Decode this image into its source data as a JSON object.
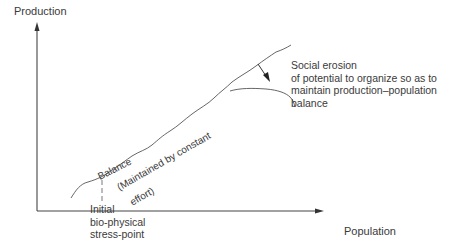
{
  "diagram": {
    "y_axis_label": "Production",
    "x_axis_label": "Population",
    "curve_label_balance": "Balance",
    "curve_label_maintained_1": "(Maintained by constant",
    "curve_label_maintained_2": "effort)",
    "stress_point_label": [
      "Initial",
      "bio-physical",
      "stress-point"
    ],
    "erosion_label": [
      "Social erosion",
      "of potential to organize so as to",
      "maintain production–population",
      "balance"
    ]
  },
  "colors": {
    "line": "#444444",
    "text": "#3a3a3a",
    "background": "#ffffff"
  }
}
